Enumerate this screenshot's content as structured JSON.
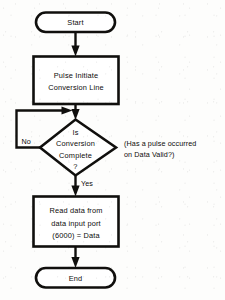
{
  "diagram": {
    "colors": {
      "stroke": "#100f0d",
      "fill": "#ffffff",
      "background": "#fdfdfc",
      "text": "#0d0c0b"
    },
    "nodes": {
      "start": {
        "kind": "terminator",
        "label": "Start"
      },
      "pulse": {
        "kind": "process",
        "line1": "Pulse Initiate",
        "line2": "Conversion Line"
      },
      "decision": {
        "kind": "decision",
        "line1": "Is",
        "line2": "Conversion",
        "line3": "Complete",
        "line4": "?"
      },
      "read": {
        "kind": "process",
        "line1": "Read data from",
        "line2": "data input port",
        "line3": "(6000) = Data"
      },
      "end": {
        "kind": "terminator",
        "label": "End"
      }
    },
    "edge_labels": {
      "no": "No",
      "yes": "Yes"
    },
    "annotation": {
      "line1": "(Has a pulse occurred",
      "line2": "on Data Valid?)"
    }
  }
}
